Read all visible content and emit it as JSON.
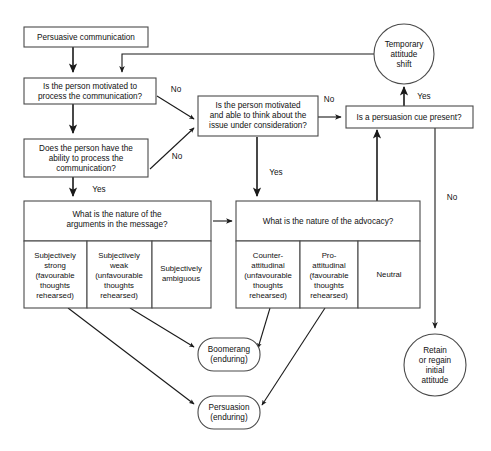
{
  "diagram": {
    "nodes": {
      "start": {
        "label": "Persuasive communication",
        "lines": [
          "Persuasive communication"
        ]
      },
      "motivated": {
        "lines": [
          "Is the person motivated to",
          "process the communication?"
        ]
      },
      "ability": {
        "lines": [
          "Does the person have the",
          "ability to process the",
          "communication?"
        ]
      },
      "think": {
        "lines": [
          "Is the person motivated",
          "and able to think about the",
          "issue under consideration?"
        ]
      },
      "cue": {
        "lines": [
          "Is a persuasion cue present?"
        ]
      },
      "temporary": {
        "lines": [
          "Temporary",
          "attitude",
          "shift"
        ]
      },
      "retain": {
        "lines": [
          "Retain",
          "or regain",
          "initial",
          "attitude"
        ]
      },
      "boomerang": {
        "lines": [
          "Boomerang",
          "(enduring)"
        ]
      },
      "persuasion": {
        "lines": [
          "Persuasion",
          "(enduring)"
        ]
      }
    },
    "message_table": {
      "header": [
        "What is the nature of the",
        "arguments in the message?"
      ],
      "cells": [
        {
          "lines": [
            "Subjectively",
            "strong",
            "(favourable",
            "thoughts",
            "rehearsed)"
          ]
        },
        {
          "lines": [
            "Subjectively",
            "weak",
            "(unfavourable",
            "thoughts",
            "rehearsed)"
          ]
        },
        {
          "lines": [
            "Subjectively",
            "ambiguous"
          ]
        }
      ]
    },
    "advocacy_table": {
      "header": [
        "What is the nature of the advocacy?"
      ],
      "cells": [
        {
          "lines": [
            "Counter-",
            "attitudinal",
            "(unfavourable",
            "thoughts",
            "rehearsed)"
          ]
        },
        {
          "lines": [
            "Pro-",
            "attitudinal",
            "(favourable",
            "thoughts",
            "rehearsed)"
          ]
        },
        {
          "lines": [
            "Neutral"
          ]
        }
      ]
    },
    "edge_labels": {
      "motivated_no": "No",
      "ability_no": "No",
      "ability_yes": "Yes",
      "think_no": "No",
      "think_yes": "Yes",
      "cue_yes": "Yes",
      "cue_no": "No"
    },
    "colors": {
      "stroke": "#4a4a4a",
      "connector": "#1a1a1a",
      "background": "#ffffff",
      "text": "#111111"
    }
  }
}
